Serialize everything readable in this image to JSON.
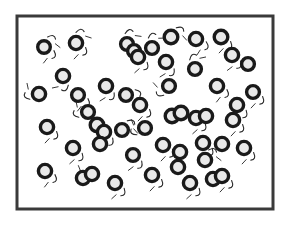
{
  "figure": {
    "name": "particles-in-container",
    "title": "",
    "caption": "",
    "width": 291,
    "height": 226,
    "background_color": "#ffffff"
  },
  "container": {
    "name": "container-box",
    "x": 17,
    "y": 16,
    "width": 256,
    "height": 193,
    "border_color": "#3a3a3a",
    "border_width": 3,
    "fill_color": "#ffffff"
  },
  "style": {
    "particle_stroke_color": "#1a1a1a",
    "particle_fill_color": "#e9e9e9",
    "particle_stroke_width": 3.4,
    "particle_radius": 6.3,
    "motion_mark_color": "#2a2a2a",
    "motion_mark_width": 1.1
  },
  "chart_data": {
    "type": "scatter",
    "title": "",
    "subtitle": "",
    "xlabel": "",
    "ylabel": "",
    "xlim": [
      17,
      273
    ],
    "ylim": [
      16,
      209
    ],
    "grid": false,
    "legend": null,
    "annotations": [],
    "particle_count": 52,
    "marker": {
      "shape": "ring",
      "radius": 6.3,
      "stroke": "#1a1a1a",
      "fill": "#e9e9e9"
    },
    "particles": [
      {
        "x": 44,
        "y": 47,
        "r": 6.3
      },
      {
        "x": 76,
        "y": 43,
        "r": 6.6
      },
      {
        "x": 127,
        "y": 44,
        "r": 6.4
      },
      {
        "x": 134,
        "y": 51,
        "r": 6.4
      },
      {
        "x": 138,
        "y": 57,
        "r": 6.6
      },
      {
        "x": 166,
        "y": 62,
        "r": 6.6
      },
      {
        "x": 171,
        "y": 37,
        "r": 6.8
      },
      {
        "x": 196,
        "y": 39,
        "r": 6.6
      },
      {
        "x": 221,
        "y": 37,
        "r": 6.8
      },
      {
        "x": 232,
        "y": 55,
        "r": 6.6
      },
      {
        "x": 195,
        "y": 69,
        "r": 6.4
      },
      {
        "x": 63,
        "y": 76,
        "r": 6.6
      },
      {
        "x": 39,
        "y": 94,
        "r": 6.6
      },
      {
        "x": 78,
        "y": 95,
        "r": 6.4
      },
      {
        "x": 106,
        "y": 86,
        "r": 6.6
      },
      {
        "x": 126,
        "y": 95,
        "r": 6.4
      },
      {
        "x": 140,
        "y": 105,
        "r": 6.6
      },
      {
        "x": 169,
        "y": 86,
        "r": 6.4
      },
      {
        "x": 217,
        "y": 86,
        "r": 6.6
      },
      {
        "x": 237,
        "y": 105,
        "r": 6.6
      },
      {
        "x": 47,
        "y": 127,
        "r": 6.6
      },
      {
        "x": 97,
        "y": 125,
        "r": 6.8
      },
      {
        "x": 104,
        "y": 132,
        "r": 6.6
      },
      {
        "x": 100,
        "y": 144,
        "r": 6.6
      },
      {
        "x": 122,
        "y": 130,
        "r": 6.4
      },
      {
        "x": 145,
        "y": 128,
        "r": 6.4
      },
      {
        "x": 172,
        "y": 116,
        "r": 6.8
      },
      {
        "x": 181,
        "y": 113,
        "r": 6.8
      },
      {
        "x": 196,
        "y": 118,
        "r": 6.6
      },
      {
        "x": 206,
        "y": 116,
        "r": 6.6
      },
      {
        "x": 233,
        "y": 120,
        "r": 6.6
      },
      {
        "x": 73,
        "y": 148,
        "r": 6.6
      },
      {
        "x": 133,
        "y": 155,
        "r": 6.4
      },
      {
        "x": 163,
        "y": 145,
        "r": 6.6
      },
      {
        "x": 180,
        "y": 152,
        "r": 6.6
      },
      {
        "x": 203,
        "y": 143,
        "r": 6.6
      },
      {
        "x": 222,
        "y": 144,
        "r": 6.6
      },
      {
        "x": 244,
        "y": 148,
        "r": 6.6
      },
      {
        "x": 45,
        "y": 171,
        "r": 6.6
      },
      {
        "x": 83,
        "y": 178,
        "r": 6.6
      },
      {
        "x": 92,
        "y": 174,
        "r": 6.6
      },
      {
        "x": 115,
        "y": 183,
        "r": 6.6
      },
      {
        "x": 152,
        "y": 175,
        "r": 6.6
      },
      {
        "x": 178,
        "y": 167,
        "r": 6.6
      },
      {
        "x": 190,
        "y": 183,
        "r": 6.6
      },
      {
        "x": 213,
        "y": 179,
        "r": 6.6
      },
      {
        "x": 222,
        "y": 176,
        "r": 6.6
      },
      {
        "x": 205,
        "y": 160,
        "r": 6.6
      },
      {
        "x": 152,
        "y": 48,
        "r": 6.4
      },
      {
        "x": 88,
        "y": 112,
        "r": 6.4
      },
      {
        "x": 248,
        "y": 64,
        "r": 6.4
      },
      {
        "x": 253,
        "y": 92,
        "r": 6.4
      }
    ],
    "motion_marks": [
      {
        "cx": 44,
        "cy": 47,
        "angle": -70
      },
      {
        "cx": 44,
        "cy": 47,
        "angle": 20
      },
      {
        "cx": 76,
        "cy": 43,
        "angle": 25
      },
      {
        "cx": 76,
        "cy": 43,
        "angle": -90
      },
      {
        "cx": 127,
        "cy": 44,
        "angle": -100
      },
      {
        "cx": 138,
        "cy": 57,
        "angle": 30
      },
      {
        "cx": 166,
        "cy": 62,
        "angle": 40
      },
      {
        "cx": 171,
        "cy": 37,
        "angle": -60
      },
      {
        "cx": 196,
        "cy": 39,
        "angle": 15
      },
      {
        "cx": 221,
        "cy": 37,
        "angle": 25
      },
      {
        "cx": 232,
        "cy": 55,
        "angle": 35
      },
      {
        "cx": 195,
        "cy": 69,
        "angle": -120
      },
      {
        "cx": 63,
        "cy": 76,
        "angle": 60
      },
      {
        "cx": 39,
        "cy": 94,
        "angle": 150
      },
      {
        "cx": 78,
        "cy": 95,
        "angle": 20
      },
      {
        "cx": 106,
        "cy": 86,
        "angle": 40
      },
      {
        "cx": 126,
        "cy": 95,
        "angle": -30
      },
      {
        "cx": 140,
        "cy": 105,
        "angle": 25
      },
      {
        "cx": 169,
        "cy": 86,
        "angle": 120
      },
      {
        "cx": 217,
        "cy": 86,
        "angle": 20
      },
      {
        "cx": 237,
        "cy": 105,
        "angle": 30
      },
      {
        "cx": 47,
        "cy": 127,
        "angle": 25
      },
      {
        "cx": 104,
        "cy": 132,
        "angle": 35
      },
      {
        "cx": 122,
        "cy": 130,
        "angle": -60
      },
      {
        "cx": 145,
        "cy": 128,
        "angle": 140
      },
      {
        "cx": 196,
        "cy": 118,
        "angle": 30
      },
      {
        "cx": 233,
        "cy": 120,
        "angle": 25
      },
      {
        "cx": 73,
        "cy": 148,
        "angle": 30
      },
      {
        "cx": 133,
        "cy": 155,
        "angle": 35
      },
      {
        "cx": 163,
        "cy": 145,
        "angle": 25
      },
      {
        "cx": 203,
        "cy": 143,
        "angle": 30
      },
      {
        "cx": 244,
        "cy": 148,
        "angle": 25
      },
      {
        "cx": 45,
        "cy": 171,
        "angle": 20
      },
      {
        "cx": 92,
        "cy": 174,
        "angle": 140
      },
      {
        "cx": 115,
        "cy": 183,
        "angle": 30
      },
      {
        "cx": 152,
        "cy": 175,
        "angle": 25
      },
      {
        "cx": 190,
        "cy": 183,
        "angle": 30
      },
      {
        "cx": 222,
        "cy": 176,
        "angle": 25
      },
      {
        "cx": 205,
        "cy": 160,
        "angle": -70
      },
      {
        "cx": 152,
        "cy": 48,
        "angle": -110
      },
      {
        "cx": 88,
        "cy": 112,
        "angle": 150
      },
      {
        "cx": 253,
        "cy": 92,
        "angle": 25
      }
    ]
  }
}
